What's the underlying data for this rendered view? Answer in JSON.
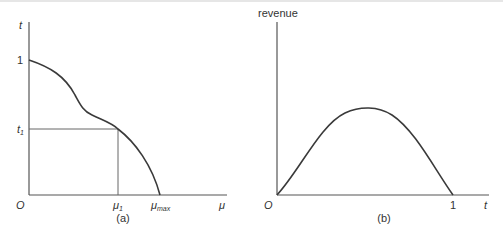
{
  "panel_a": {
    "caption": "(a)",
    "y_axis_label": "t",
    "x_axis_label": "μ",
    "origin_label": "O",
    "y_tick_top": "1",
    "y_tick_t1_main": "t",
    "y_tick_t1_sub": "1",
    "x_tick_mu1_main": "μ",
    "x_tick_mu1_sub": "1",
    "x_tick_mumax_main": "μ",
    "x_tick_mumax_sub": "max"
  },
  "panel_b": {
    "caption": "(b)",
    "y_axis_label": "revenue",
    "x_axis_label": "t",
    "origin_label": "O",
    "x_tick_end": "1"
  },
  "colors": {
    "line": "#3a3a3a",
    "axis": "#555555",
    "text": "#333333"
  }
}
